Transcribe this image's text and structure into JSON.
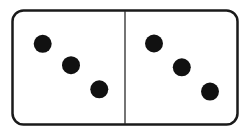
{
  "domino": {
    "label": "Domino tile 3-3",
    "left_half": {
      "value": 3
    },
    "right_half": {
      "value": 3
    },
    "colors": {
      "border": "#1a1a1a",
      "pip": "#111111",
      "face": "#ffffff"
    }
  }
}
